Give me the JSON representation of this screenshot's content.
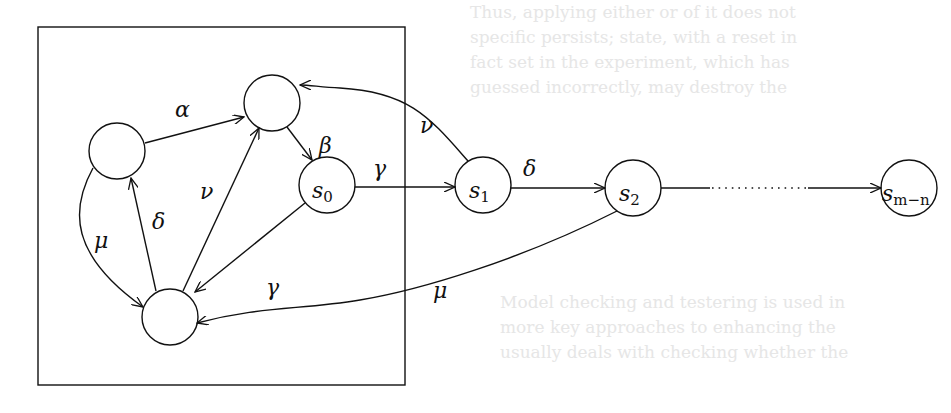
{
  "background_bleed": {
    "top_lines": [
      "Thus, applying either or of it does not",
      "specific persists; state, with a reset in",
      "fact set in the experiment, which has",
      "guessed incorrectly, may destroy the"
    ],
    "bottom_lines": [
      "Model checking and testering is used in",
      "more key approaches to enhancing the",
      "usually deals with checking whether the"
    ]
  },
  "diagram": {
    "stroke_color": "#111111",
    "box": {
      "x": 38,
      "y": 27,
      "w": 367,
      "h": 358
    },
    "nodes": [
      {
        "id": "top",
        "label": "",
        "cx": 272,
        "cy": 103,
        "r": 28
      },
      {
        "id": "left",
        "label": "",
        "cx": 117,
        "cy": 151,
        "r": 28
      },
      {
        "id": "bottom",
        "label": "",
        "cx": 170,
        "cy": 317,
        "r": 28
      },
      {
        "id": "s0",
        "label": "s",
        "sub": "0",
        "cx": 327,
        "cy": 185,
        "r": 28
      },
      {
        "id": "s1",
        "label": "s",
        "sub": "1",
        "cx": 483,
        "cy": 185,
        "r": 28
      },
      {
        "id": "s2",
        "label": "s",
        "sub": "2",
        "cx": 633,
        "cy": 188,
        "r": 28
      },
      {
        "id": "smn",
        "label": "s",
        "sub": "m−n",
        "cx": 909,
        "cy": 188,
        "r": 28
      }
    ],
    "edges": [
      {
        "from": "left",
        "to": "top",
        "label": "α"
      },
      {
        "from": "top",
        "to": "s0",
        "label": "β"
      },
      {
        "from": "s0",
        "to": "s1",
        "label": "γ"
      },
      {
        "from": "s0",
        "to": "bottom",
        "label": "γ"
      },
      {
        "from": "s1",
        "to": "top",
        "label": "ν"
      },
      {
        "from": "bottom",
        "to": "top",
        "label": "ν"
      },
      {
        "from": "bottom",
        "to": "left",
        "label": "δ"
      },
      {
        "from": "s1",
        "to": "s2",
        "label": "δ"
      },
      {
        "from": "left",
        "to": "bottom",
        "label": "μ"
      },
      {
        "from": "s2",
        "to": "bottom",
        "label": "μ"
      },
      {
        "from": "s2",
        "to": "smn",
        "label": "",
        "style": "dotted-middle"
      }
    ],
    "labels": {
      "alpha": "α",
      "beta": "β",
      "gamma_s0_s1": "γ",
      "gamma_s0_bottom": "γ",
      "nu_s1_top": "ν",
      "nu_bottom_top": "ν",
      "delta_bottom_left": "δ",
      "delta_s1_s2": "δ",
      "mu_left_bottom": "μ",
      "mu_s2_bottom": "μ",
      "s0": "s",
      "s0_sub": "0",
      "s1": "s",
      "s1_sub": "1",
      "s2": "s",
      "s2_sub": "2",
      "smn": "s",
      "smn_sub": "m−n"
    }
  }
}
